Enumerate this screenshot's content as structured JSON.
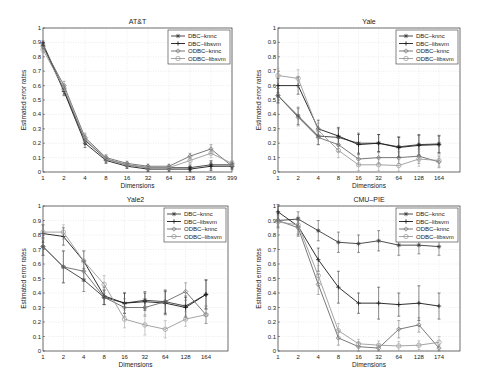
{
  "chart_data": [
    {
      "type": "line",
      "title": "AT&T",
      "xlabel": "Dimensions",
      "ylabel": "Estimated error rates",
      "categories": [
        "1",
        "2",
        "4",
        "8",
        "16",
        "32",
        "64",
        "128",
        "256",
        "399"
      ],
      "ylim": [
        0,
        1
      ],
      "yticks": [
        "0",
        "0.1",
        "0.2",
        "0.3",
        "0.4",
        "0.5",
        "0.6",
        "0.7",
        "0.8",
        "0.9",
        "1"
      ],
      "grid": true,
      "legend_position": "upper right",
      "series": [
        {
          "name": "DBC–knnc",
          "values": [
            0.89,
            0.57,
            0.22,
            0.09,
            0.05,
            0.03,
            0.03,
            0.03,
            0.05,
            0.05
          ],
          "err": [
            0.02,
            0.03,
            0.03,
            0.02,
            0.015,
            0.015,
            0.015,
            0.02,
            0.03,
            0.02
          ]
        },
        {
          "name": "DBC–libsvm",
          "values": [
            0.88,
            0.56,
            0.2,
            0.08,
            0.04,
            0.02,
            0.02,
            0.02,
            0.04,
            0.04
          ],
          "err": [
            0.02,
            0.03,
            0.03,
            0.02,
            0.015,
            0.015,
            0.015,
            0.02,
            0.03,
            0.02
          ]
        },
        {
          "name": "ODBC–knnc",
          "values": [
            0.87,
            0.6,
            0.24,
            0.1,
            0.06,
            0.04,
            0.04,
            0.11,
            0.16,
            0.04
          ],
          "err": [
            0.02,
            0.03,
            0.03,
            0.02,
            0.015,
            0.015,
            0.015,
            0.02,
            0.03,
            0.02
          ]
        },
        {
          "name": "ODBC–libsvm",
          "values": [
            0.85,
            0.58,
            0.23,
            0.09,
            0.05,
            0.03,
            0.03,
            0.08,
            0.13,
            0.06
          ],
          "err": [
            0.02,
            0.03,
            0.03,
            0.02,
            0.015,
            0.015,
            0.015,
            0.02,
            0.03,
            0.02
          ]
        }
      ]
    },
    {
      "type": "line",
      "title": "Yale",
      "xlabel": "Dimensions",
      "ylabel": "Estimated error rates",
      "categories": [
        "1",
        "2",
        "4",
        "8",
        "16",
        "32",
        "64",
        "128",
        "164"
      ],
      "ylim": [
        0,
        1
      ],
      "yticks": [
        "0",
        "0.1",
        "0.2",
        "0.3",
        "0.4",
        "0.5",
        "0.6",
        "0.7",
        "0.8",
        "0.9",
        "1"
      ],
      "grid": true,
      "legend_position": "upper right",
      "series": [
        {
          "name": "DBC–knnc",
          "values": [
            0.53,
            0.39,
            0.25,
            0.24,
            0.2,
            0.2,
            0.175,
            0.19,
            0.195
          ],
          "err": [
            0.05,
            0.06,
            0.06,
            0.06,
            0.07,
            0.06,
            0.07,
            0.07,
            0.06
          ]
        },
        {
          "name": "DBC–libsvm",
          "values": [
            0.6,
            0.6,
            0.3,
            0.25,
            0.19,
            0.2,
            0.17,
            0.185,
            0.19
          ],
          "err": [
            0.05,
            0.06,
            0.06,
            0.06,
            0.07,
            0.06,
            0.07,
            0.07,
            0.06
          ]
        },
        {
          "name": "ODBC–knnc",
          "values": [
            0.53,
            0.38,
            0.24,
            0.19,
            0.09,
            0.1,
            0.1,
            0.11,
            0.07
          ],
          "err": [
            0.05,
            0.06,
            0.05,
            0.05,
            0.04,
            0.04,
            0.04,
            0.05,
            0.04
          ]
        },
        {
          "name": "ODBC–libsvm",
          "values": [
            0.67,
            0.65,
            0.29,
            0.15,
            0.05,
            0.05,
            0.045,
            0.09,
            0.08
          ],
          "err": [
            0.05,
            0.06,
            0.05,
            0.05,
            0.04,
            0.04,
            0.04,
            0.05,
            0.04
          ]
        }
      ]
    },
    {
      "type": "line",
      "title": "Yale2",
      "xlabel": "Dimensions",
      "ylabel": "Estimated error rates",
      "categories": [
        "1",
        "2",
        "4",
        "8",
        "16",
        "32",
        "64",
        "128",
        "164"
      ],
      "ylim": [
        0,
        1
      ],
      "yticks": [
        "0",
        "0.1",
        "0.2",
        "0.3",
        "0.4",
        "0.5",
        "0.6",
        "0.7",
        "0.8",
        "0.9",
        "1"
      ],
      "grid": true,
      "legend_position": "upper right",
      "series": [
        {
          "name": "DBC–knnc",
          "values": [
            0.72,
            0.58,
            0.49,
            0.37,
            0.33,
            0.35,
            0.34,
            0.31,
            0.39
          ],
          "err": [
            0.06,
            0.11,
            0.08,
            0.05,
            0.07,
            0.06,
            0.08,
            0.07,
            0.1
          ]
        },
        {
          "name": "DBC–libsvm",
          "values": [
            0.81,
            0.79,
            0.62,
            0.38,
            0.33,
            0.34,
            0.33,
            0.3,
            0.39
          ],
          "err": [
            0.06,
            0.06,
            0.07,
            0.06,
            0.07,
            0.06,
            0.08,
            0.07,
            0.1
          ]
        },
        {
          "name": "ODBC–knnc",
          "values": [
            0.72,
            0.58,
            0.55,
            0.37,
            0.3,
            0.3,
            0.34,
            0.41,
            0.25
          ],
          "err": [
            0.06,
            0.11,
            0.07,
            0.05,
            0.06,
            0.06,
            0.08,
            0.06,
            0.06
          ]
        },
        {
          "name": "ODBC–libsvm",
          "values": [
            0.82,
            0.82,
            0.62,
            0.46,
            0.22,
            0.18,
            0.15,
            0.22,
            0.25
          ],
          "err": [
            0.05,
            0.05,
            0.07,
            0.06,
            0.06,
            0.07,
            0.06,
            0.05,
            0.06
          ]
        }
      ]
    },
    {
      "type": "line",
      "title": "CMU–PIE",
      "xlabel": "Dimensions",
      "ylabel": "Estimated error rates",
      "categories": [
        "1",
        "2",
        "4",
        "8",
        "16",
        "32",
        "64",
        "128",
        "174"
      ],
      "ylim": [
        0,
        1
      ],
      "yticks": [
        "0",
        "0.1",
        "0.2",
        "0.3",
        "0.4",
        "0.5",
        "0.6",
        "0.7",
        "0.8",
        "0.9",
        "1"
      ],
      "grid": true,
      "legend_position": "upper right",
      "series": [
        {
          "name": "DBC–knnc",
          "values": [
            0.9,
            0.91,
            0.83,
            0.75,
            0.74,
            0.76,
            0.73,
            0.73,
            0.72
          ],
          "err": [
            0.05,
            0.05,
            0.07,
            0.07,
            0.06,
            0.07,
            0.07,
            0.06,
            0.06
          ]
        },
        {
          "name": "DBC–libsvm",
          "values": [
            0.96,
            0.86,
            0.63,
            0.44,
            0.33,
            0.33,
            0.32,
            0.33,
            0.31
          ],
          "err": [
            0.05,
            0.06,
            0.08,
            0.11,
            0.07,
            0.11,
            0.08,
            0.12,
            0.09
          ]
        },
        {
          "name": "ODBC–knnc",
          "values": [
            0.9,
            0.85,
            0.46,
            0.09,
            0.03,
            0.02,
            0.15,
            0.18,
            0.02
          ],
          "err": [
            0.04,
            0.06,
            0.07,
            0.05,
            0.03,
            0.02,
            0.06,
            0.05,
            0.02
          ]
        },
        {
          "name": "ODBC–libsvm",
          "values": [
            0.89,
            0.87,
            0.52,
            0.14,
            0.05,
            0.04,
            0.035,
            0.04,
            0.06
          ],
          "err": [
            0.04,
            0.06,
            0.07,
            0.05,
            0.03,
            0.03,
            0.03,
            0.03,
            0.04
          ]
        }
      ]
    }
  ],
  "legend": [
    "DBC–knnc",
    "DBC–libsvm",
    "ODBC–knnc",
    "ODBC–libsvm"
  ],
  "colors": {
    "series": [
      "#3a3a3a",
      "#1a1a1a",
      "#6a6a6a",
      "#9a9a9a"
    ],
    "grid": "#d8d8d8",
    "axis": "#333333"
  }
}
